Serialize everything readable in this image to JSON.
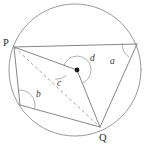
{
  "figure": {
    "kind": "circle-geometry-diagram",
    "colors": {
      "background": "#ffffff",
      "circle_stroke": "#8d8d8d",
      "chord_stroke": "#7f7f7f",
      "dashed_stroke": "#9a9a9a",
      "arc_stroke": "#9b9b9b",
      "centre_dot": "#1a1a1a",
      "label_color": "#3a3a3a"
    },
    "circle": {
      "cx": 75,
      "cy": 70,
      "r": 66
    },
    "centre_point": {
      "name": "centre-dot",
      "cx": 77,
      "cy": 70,
      "r": 2.4
    },
    "points": [
      {
        "id": "P",
        "label": "P",
        "x": 14,
        "y": 47,
        "label_x": 3,
        "label_y": 46
      },
      {
        "id": "R",
        "label": "",
        "x": 137,
        "y": 44,
        "label_x": 0,
        "label_y": 0
      },
      {
        "id": "Q",
        "label": "Q",
        "x": 100,
        "y": 127,
        "label_x": 100,
        "label_y": 141
      },
      {
        "id": "S",
        "label": "",
        "x": 20,
        "y": 105,
        "label_x": 0,
        "label_y": 0
      },
      {
        "id": "O",
        "label": "",
        "x": 77,
        "y": 70,
        "label_x": 0,
        "label_y": 0
      }
    ],
    "segments": [
      {
        "id": "P-R",
        "d": "M 14 47 L 137 44",
        "style": "solid"
      },
      {
        "id": "P-O",
        "d": "M 14 47 L 77 70",
        "style": "solid"
      },
      {
        "id": "P-S",
        "d": "M 14 47 L 20 105",
        "style": "solid"
      },
      {
        "id": "S-Q",
        "d": "M 20 105 L 100 127",
        "style": "solid"
      },
      {
        "id": "O-Q",
        "d": "M 77 70 L 100 127",
        "style": "solid"
      },
      {
        "id": "R-Q",
        "d": "M 137 44 L 100 127",
        "style": "solid"
      },
      {
        "id": "P-Q",
        "d": "M 14 47 L 100 127",
        "style": "dashed"
      }
    ],
    "angle_arcs": [
      {
        "id": "angle-a",
        "label": "a",
        "label_x": 110,
        "label_y": 64,
        "d": "M 122.2 43.7 A 15 15 0 0 0 128.7 56.9",
        "vertex": "R"
      },
      {
        "id": "angle-b",
        "label": "b",
        "label_x": 36,
        "label_y": 97,
        "d": "M 18.5 90.1 A 15 15 0 0 1 34.6 108.9",
        "vertex": "S"
      },
      {
        "id": "angle-c",
        "label": "c",
        "label_x": 57,
        "label_y": 86,
        "d": "M 65.9 75.7 A 14 14 0 0 1 55.6 79.3",
        "vertex": "P-dashed"
      },
      {
        "id": "angle-d",
        "label": "d",
        "label_x": 90,
        "label_y": 61,
        "d": "M 63.9 65.4 A 14 14 0 1 1 82.4 83.0",
        "vertex": "O"
      }
    ],
    "vertex_labels": [
      {
        "id": "label-P",
        "text": "P",
        "x": 3,
        "y": 46
      },
      {
        "id": "label-Q",
        "text": "Q",
        "x": 99,
        "y": 141
      }
    ]
  }
}
